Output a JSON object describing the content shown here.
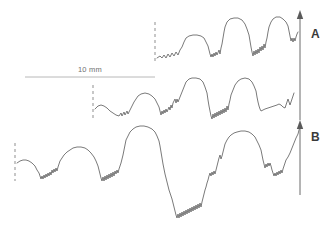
{
  "figure": {
    "width": 334,
    "height": 237,
    "background_color": "#ffffff",
    "trace_color": "#6b6b6b",
    "reference_line_color": "#9a9a9a",
    "scale_bar_color": "#b0b0b0",
    "label_color": "#3a3a3a"
  },
  "scale_bar": {
    "label": "10 mm",
    "label_x": 78,
    "label_y": 65,
    "x1": 25,
    "x2": 155,
    "y": 77
  },
  "panels": [
    {
      "id": "A",
      "label": "A",
      "label_x": 311,
      "label_y": 27,
      "axis": {
        "x": 300,
        "y_top": 14,
        "y_bottom": 120,
        "arrow": "up"
      }
    },
    {
      "id": "B",
      "label": "B",
      "label_x": 311,
      "label_y": 130,
      "axis": {
        "x": 300,
        "y_top": 124,
        "y_bottom": 195,
        "arrow": "up"
      }
    }
  ],
  "reference_lines": [
    {
      "name": "ref-line-top",
      "x": 155,
      "y1": 22,
      "y2": 62
    },
    {
      "name": "ref-line-middle",
      "x": 93,
      "y1": 85,
      "y2": 118
    },
    {
      "name": "ref-line-bottom",
      "x": 15,
      "y1": 143,
      "y2": 181
    }
  ],
  "chart_data": {
    "type": "line",
    "title": "",
    "xlabel": "",
    "ylabel": "",
    "grid": false,
    "legend": "none",
    "scale_bar_mm": 10,
    "scale_bar_px": 130,
    "series": [
      {
        "name": "trace-A-upper",
        "panel": "A",
        "color": "#6b6b6b",
        "path": "M157,58 L160,56 L162,58 L164,55 L166,58 L168,54 L170,57 L172,53 L174,56 L176,52 L178,55 L180,50 L182,47 L184,42 L186,38 L189,36 L193,35 L197,35 L201,36 L204,38 L206,42 L208,46 L209,50 L210,54 L211,57 L212,54 L213,57 L214,53 L215,56 L216,52 L217,55 L219,50 L220,54 L221,48 L222,44 L223,38 L224,32 L225,27 L227,22 L230,19 L234,18 L238,18 L242,20 L245,24 L247,29 L249,35 L250,41 L251,47 L252,52 L253,56 L254,51 L255,55 L256,50 L257,54 L258,49 L259,53 L260,47 L261,51 L262,46 L263,50 L264,44 L265,48 L266,42 L267,38 L268,32 L269,27 L271,22 L273,19 L276,17 L280,17 L283,19 L286,22 L288,26 L289,31 L290,36 L291,41 L292,38 L293,42 L294,38 L295,41 L296,37 L297,34 L298,32"
      },
      {
        "name": "trace-A-lower",
        "panel": "A",
        "color": "#6b6b6b",
        "path": "M95,109 L98,106 L101,105 L104,106 L107,108 L110,111 L113,113 L116,115 L119,116 L121,113 L122,116 L124,112 L125,115 L127,111 L128,114 L130,110 L132,106 L134,102 L136,99 L138,96 L141,94 L145,93 L149,94 L152,96 L155,99 L157,103 L159,107 L160,111 L161,115 L162,111 L163,114 L164,110 L165,113 L166,109 L167,112 L169,107 L170,110 L171,105 L172,108 L173,103 L175,99 L176,103 L177,99 L178,102 L180,97 L182,92 L184,87 L186,82 L189,79 L192,78 L196,78 L200,79 L203,82 L205,87 L207,93 L208,100 L209,106 L210,111 L211,116 L212,119 L213,114 L214,118 L215,113 L216,117 L217,112 L218,116 L219,111 L220,115 L221,110 L222,114 L223,109 L224,113 L225,108 L226,112 L227,106 L228,110 L229,104 L230,100 L231,95 L233,90 L235,85 L238,81 L241,79 L245,78 L249,79 L252,82 L254,86 L256,91 L257,97 L258,102 L259,106 L260,109 L261,111 L263,110 L265,109 L268,108 L271,107 L274,106 L277,105 L279,104 L281,105 L283,107 L285,108 L286,105 L287,102 L288,99 L289,102 L290,105 L291,102 L292,99 L293,96 L294,93"
      },
      {
        "name": "trace-B",
        "panel": "B",
        "color": "#6b6b6b",
        "path": "M17,163 L20,161 L23,160 L26,160 L29,161 L32,163 L35,166 L37,170 L39,173 L40,176 L41,179 L42,176 L43,179 L44,175 L45,178 L46,174 L47,177 L48,173 L49,176 L50,172 L51,175 L52,170 L53,173 L54,169 L55,172 L56,168 L57,171 L58,167 L59,164 L60,161 L62,158 L64,155 L67,152 L70,150 L73,148 L77,147 L81,147 L85,148 L88,150 L91,153 L94,157 L96,161 L98,166 L99,170 L100,174 L101,178 L102,181 L103,177 L104,181 L105,176 L106,180 L107,175 L108,179 L109,174 L110,178 L111,173 L112,177 L113,172 L114,176 L115,171 L116,174 L117,170 L118,173 L119,169 L120,166 L121,163 L122,159 L123,155 L124,150 L125,145 L126,140 L128,136 L130,132 L133,129 L136,127 L140,126 L144,126 L148,127 L152,129 L155,132 L157,136 L159,141 L160,146 L161,152 L162,158 L163,164 L164,169 L165,174 L166,178 L167,182 L168,186 L169,190 L170,193 L171,196 L172,199 L173,203 L174,207 L175,211 L176,215 L177,218 L178,214 L179,218 L180,213 L181,217 L182,212 L183,216 L184,211 L185,215 L186,210 L187,214 L188,209 L189,213 L190,208 L191,212 L192,207 L193,211 L194,206 L195,210 L196,205 L197,209 L198,204 L199,208 L200,203 L201,207 L202,202 L203,198 L204,194 L205,190 L206,187 L207,183 L208,180 L209,176 L210,173 L211,176 L212,172 L213,175 L214,171 L215,174 L216,170 L217,166 L218,162 L219,158 L220,155 L221,159 L222,156 L223,152 L224,148 L225,144 L227,140 L229,137 L231,135 L234,133 L237,132 L241,131 L245,131 L249,132 L252,134 L255,137 L257,141 L259,145 L261,150 L262,155 L263,160 L264,164 L265,168 L266,164 L267,167 L268,163 L269,166 L270,163 L271,166 L272,170 L273,173 L274,176 L275,173 L276,176 L277,172 L278,175 L279,171 L280,174 L281,170 L282,173 L283,169 L284,166 L285,163 L286,160 L288,157 L290,153 L292,148 L294,143 L296,138 L298,134 L299,130 L300,127"
      }
    ]
  }
}
